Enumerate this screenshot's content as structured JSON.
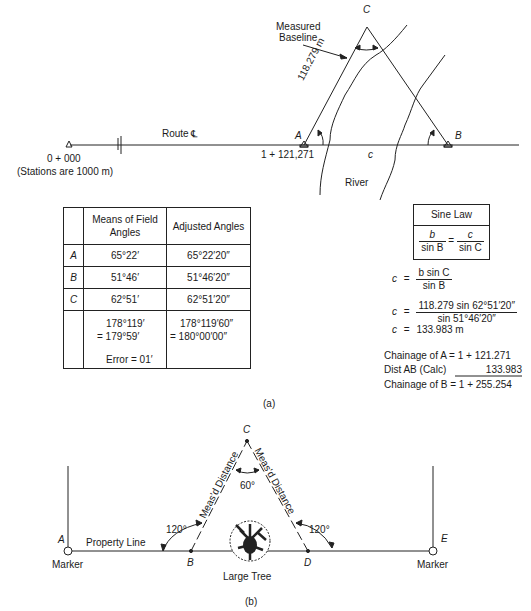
{
  "figure_a": {
    "caption": "(a)",
    "labels": {
      "measured_baseline_line1": "Measured",
      "measured_baseline_line2": "Baseline",
      "point_c": "C",
      "point_a": "A",
      "point_b": "B",
      "baseline_length": "118.279 m",
      "route": "Route",
      "centerline_symbol": "℄",
      "start_station": "0 + 000",
      "stations_note": "(Stations are 1000 m)",
      "station_a": "1 + 121,271",
      "side_c": "c",
      "river": "River"
    },
    "angles_table": {
      "headers": [
        "",
        "Means of Field Angles",
        "Adjusted Angles"
      ],
      "header_col1_line1": "Means of Field",
      "header_col1_line2": "Angles",
      "header_col2": "Adjusted Angles",
      "rows": [
        {
          "point": "A",
          "field": "65°22′",
          "adjusted": "65°22′20″"
        },
        {
          "point": "B",
          "field": "51°46′",
          "adjusted": "51°46′20″"
        },
        {
          "point": "C",
          "field": "62°51′",
          "adjusted": "62°51′20″"
        }
      ],
      "sum_field_line1": "178°119′",
      "sum_field_line2": "= 179°59′",
      "error": "Error = 01′",
      "sum_adjusted_line1": "178°119′60″",
      "sum_adjusted_line2": "= 180°00′00″"
    },
    "sine_law": {
      "title": "Sine Law",
      "lhs_num": "b",
      "lhs_den": "sin B",
      "equals": "=",
      "rhs_num": "c",
      "rhs_den": "sin C"
    },
    "computation": {
      "step1_var": "c",
      "step1_eq": "=",
      "step1_num": "b sin C",
      "step1_den": "sin B",
      "step2_var": "c",
      "step2_eq": "=",
      "step2_num": "118.279 sin 62°51′20″",
      "step2_den": "sin 51°46′20″",
      "step3_var": "c",
      "step3_eq": "=",
      "step3_val": "133.983 m"
    },
    "chainage": {
      "row1_label": "Chainage of A",
      "row1_value": "=  1 + 121.271",
      "row2_label": "Dist AB (Calc)",
      "row2_value": "133.983",
      "row3_label": "Chainage of B",
      "row3_value": "=  1 + 255.254"
    }
  },
  "figure_b": {
    "caption": "(b)",
    "labels": {
      "point_a": "A",
      "point_b": "B",
      "point_c": "C",
      "point_d": "D",
      "point_e": "E",
      "marker_left": "Marker",
      "marker_right": "Marker",
      "property_line": "Property Line",
      "large_tree": "Large Tree",
      "angle_left": "120°",
      "angle_right": "120°",
      "angle_top": "60°",
      "measured_distance_left": "Meas'd Distance",
      "measured_distance_right": "Meas'd Distance"
    }
  }
}
